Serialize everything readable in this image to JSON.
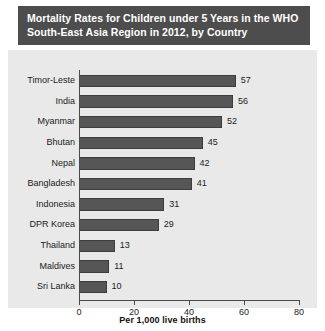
{
  "title": {
    "line1": "Mortality Rates for Children under 5 Years in the WHO",
    "line2": "South-East Asia Region in 2012, by Country"
  },
  "axis": {
    "x_title": "Per 1,000 live births",
    "ticks": [
      "0",
      "20",
      "40",
      "60",
      "80"
    ]
  },
  "colors": {
    "title_bar": "#4d4d4d",
    "title_text": "#ffffff",
    "panel_background": "#e9e9e9",
    "bar_fill": "#565656",
    "bar_edge": "#3c3c3c",
    "axis": "#4a4a4a",
    "text": "#1b1b1b"
  },
  "chart_data": {
    "type": "bar",
    "orientation": "horizontal",
    "title": "Mortality Rates for Children under 5 Years in the WHO South-East Asia Region in 2012, by Country",
    "xlabel": "Per 1,000 live births",
    "ylabel": "",
    "xlim": [
      0,
      80
    ],
    "xticks": [
      0,
      20,
      40,
      60,
      80
    ],
    "grid": false,
    "legend": false,
    "data_labels": true,
    "categories": [
      "Timor-Leste",
      "India",
      "Myanmar",
      "Bhutan",
      "Nepal",
      "Bangladesh",
      "Indonesia",
      "DPR Korea",
      "Thailand",
      "Maldives",
      "Sri Lanka"
    ],
    "values": [
      57,
      56,
      52,
      45,
      42,
      41,
      31,
      29,
      13,
      11,
      10
    ],
    "value_labels": [
      "57",
      "56",
      "52",
      "45",
      "42",
      "41",
      "31",
      "29",
      "13",
      "11",
      "10"
    ]
  }
}
